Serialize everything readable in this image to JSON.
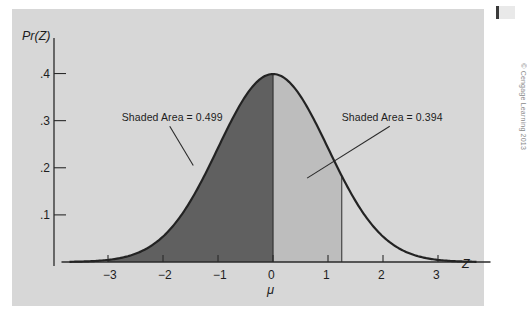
{
  "figure": {
    "credit": "© Cengage Learning 2013",
    "background_color": "#d7d7d7",
    "page_color": "#ffffff"
  },
  "chart_data": {
    "type": "area",
    "title": "",
    "subtitle": "",
    "xlabel": "μ",
    "ylabel": "Pr(Z)",
    "x_var_label": "Z",
    "xlim": [
      -3.7,
      3.7
    ],
    "ylim": [
      0,
      0.45
    ],
    "grid": false,
    "legend_position": "none",
    "curve": {
      "name": "Standard normal density",
      "distribution": "normal",
      "mean": 0,
      "sd": 1,
      "peak_value": 0.399,
      "color": "#232323",
      "line_width": 2.2
    },
    "x_ticks": [
      -3,
      -2,
      -1,
      0,
      1,
      2,
      3
    ],
    "x_tick_labels": [
      "−3",
      "−2",
      "−1",
      "0",
      "1",
      "2",
      "3"
    ],
    "y_ticks": [
      0.1,
      0.2,
      0.3,
      0.4
    ],
    "y_tick_labels": [
      ".1",
      ".2",
      ".3",
      ".4"
    ],
    "shaded_regions": [
      {
        "name": "left-region",
        "x_from": -3.0,
        "x_to": 0.0,
        "area": 0.499,
        "label": "Shaded Area = 0.499",
        "color": "#606060"
      },
      {
        "name": "right-region",
        "x_from": 0.0,
        "x_to": 1.25,
        "area": 0.394,
        "label": "Shaded Area = 0.394",
        "color": "#bdbdbd"
      }
    ],
    "annotations": [
      {
        "text": "Shaded Area = 0.499",
        "anchor_x": -1.45,
        "anchor_y": 0.205,
        "label_x": -2.75,
        "label_y": 0.305
      },
      {
        "text": "Shaded Area = 0.394",
        "anchor_x": 0.62,
        "anchor_y": 0.178,
        "label_x": 1.25,
        "label_y": 0.305
      }
    ]
  }
}
